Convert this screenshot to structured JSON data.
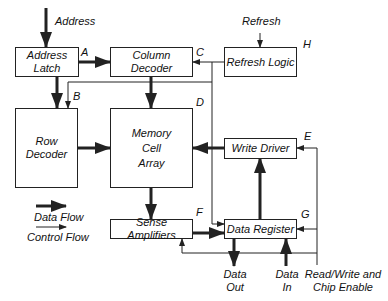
{
  "diagram": {
    "blocks": {
      "address_latch": {
        "line1": "Address",
        "line2": "Latch",
        "tag": "A"
      },
      "column_decoder": {
        "label": "Column Decoder",
        "tag": "C"
      },
      "refresh_logic": {
        "label": "Refresh Logic",
        "tag": "H"
      },
      "row_decoder": {
        "line1": "Row",
        "line2": "Decoder",
        "tag": "B"
      },
      "memory_array": {
        "line1": "Memory",
        "line2": "Cell",
        "line3": "Array",
        "tag": "D"
      },
      "write_driver": {
        "label": "Write Driver",
        "tag": "E"
      },
      "sense_amplifiers": {
        "label": "Sense Amplifiers",
        "tag": "F"
      },
      "data_register": {
        "label": "Data Register",
        "tag": "G"
      }
    },
    "signals": {
      "address": "Address",
      "refresh": "Refresh",
      "data_out_1": "Data",
      "data_out_2": "Out",
      "data_in_1": "Data",
      "data_in_2": "In",
      "rw_1": "Read/Write and",
      "rw_2": "Chip Enable"
    },
    "legend": {
      "data_flow": "Data Flow",
      "control_flow": "Control Flow"
    },
    "colors": {
      "line": "#222222",
      "background": "#ffffff"
    }
  }
}
